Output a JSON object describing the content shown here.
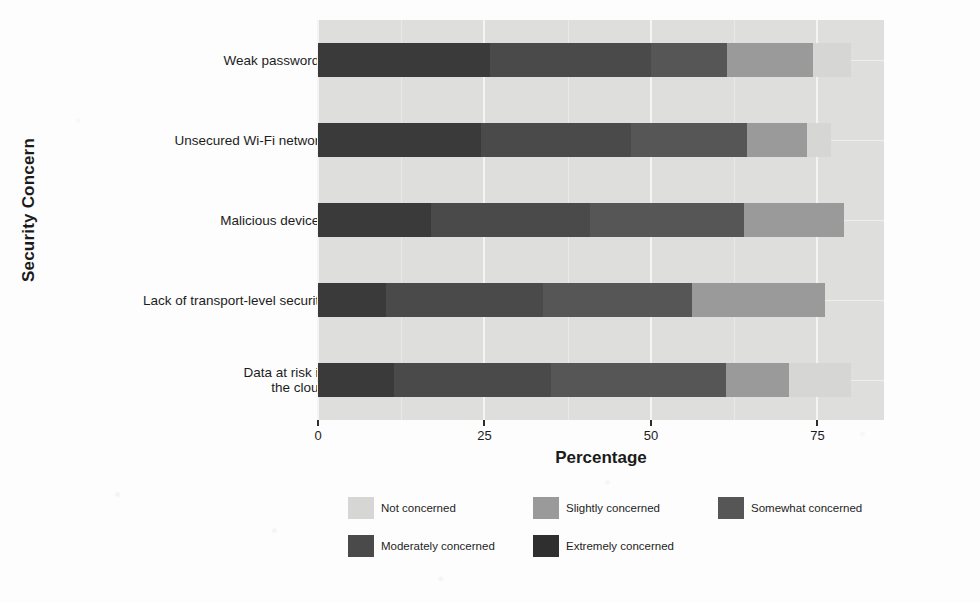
{
  "chart_data": {
    "type": "bar",
    "subtype": "stacked-horizontal-likert",
    "title": "",
    "xlabel": "Percentage",
    "ylabel": "Security Concern",
    "xlim": [
      0,
      85
    ],
    "xticks": [
      0,
      25,
      50,
      75
    ],
    "xtick_labels": [
      "0",
      "25",
      "50",
      "75"
    ],
    "grid": true,
    "legend_position": "bottom",
    "categories": [
      "Weak passwords",
      "Unsecured Wi-Fi network",
      "Malicious devices",
      "Lack of transport-level security",
      "Data at risk in\nthe cloud"
    ],
    "series": [
      {
        "name": "Extremely concerned",
        "color": "#3a3a3a",
        "values": [
          25.8,
          24.5,
          17.0,
          10.2,
          11.4
        ]
      },
      {
        "name": "Moderately concerned",
        "color": "#4a4a4a",
        "values": [
          24.2,
          22.5,
          23.8,
          23.6,
          23.6
        ]
      },
      {
        "name": "Somewhat concerned",
        "color": "#565656",
        "values": [
          11.4,
          17.5,
          23.2,
          22.4,
          26.2
        ]
      },
      {
        "name": "Slightly concerned",
        "color": "#9a9a9a",
        "values": [
          13.0,
          9.0,
          15.0,
          20.0,
          9.5
        ]
      },
      {
        "name": "Not concerned",
        "color": "#d6d6d5",
        "values": [
          5.6,
          3.5,
          0.0,
          0.0,
          9.3
        ]
      }
    ],
    "stack_order": [
      "Extremely concerned",
      "Moderately concerned",
      "Somewhat concerned",
      "Slightly concerned",
      "Not concerned"
    ],
    "legend_entries": [
      {
        "label": "Not concerned",
        "color": "#d6d6d5"
      },
      {
        "label": "Slightly concerned",
        "color": "#9a9a9a"
      },
      {
        "label": "Somewhat concerned",
        "color": "#565656"
      },
      {
        "label": "Moderately concerned",
        "color": "#4a4a4a"
      },
      {
        "label": "Extremely concerned",
        "color": "#2f2f2f"
      }
    ],
    "panel_background": "#dededd",
    "gridline_color": "#f4f4f3"
  }
}
